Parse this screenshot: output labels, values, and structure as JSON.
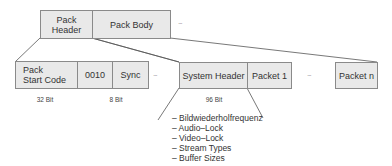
{
  "diagram": {
    "top_row": [
      {
        "label": "Pack\nHeader"
      },
      {
        "label": "Pack Body"
      }
    ],
    "top_row_ellipsis": "...",
    "bottom_row_left": [
      {
        "label": "Pack\nStart Code"
      },
      {
        "label": "0010"
      },
      {
        "label": "Sync"
      }
    ],
    "bottom_row_left_ellipsis": "...",
    "bottom_row_right": [
      {
        "label": "System Header"
      },
      {
        "label": "Packet 1"
      }
    ],
    "bottom_row_right_ellipsis": "...",
    "last_packet": {
      "label": "Packet n"
    },
    "bit_labels": [
      {
        "label": "32 Bit"
      },
      {
        "label": "8 Bit"
      },
      {
        "label": "96 Bit"
      }
    ],
    "system_header_fields": [
      "– Bildwiederholfrequenz",
      "– Audio–Lock",
      "– Video–Lock",
      "– Stream Types",
      "– Buffer Sizes"
    ],
    "colors": {
      "box_fill": "#e9e9e9",
      "box_border": "#8a8a8a",
      "line": "#555555"
    }
  }
}
